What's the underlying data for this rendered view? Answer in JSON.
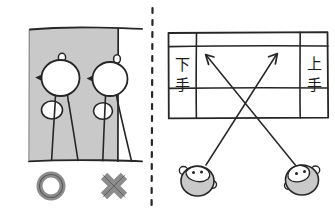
{
  "figure": {
    "background_color": "#ffffff",
    "ink_color": "#262626",
    "gray_fill_color": "#c9c9c9",
    "gray_mark_color": "#8c8c8c",
    "divider": {
      "name": "panel-divider",
      "style": "vertical-dashed",
      "x": 152,
      "y_start": 8,
      "y_end": 205,
      "dash_pattern": "5 7"
    }
  },
  "left_panel": {
    "name": "stage-position-illustration",
    "description": "Two stick figures on a gray stage floor area bounded by a vertical line",
    "stage_area": {
      "label": "gray stage floor",
      "x": 28,
      "y": 28,
      "width": 90,
      "height": 133
    },
    "boundary_line": {
      "name": "stage-edge-line",
      "orientation": "vertical",
      "x": 118
    },
    "figures": [
      {
        "name": "figure-correct",
        "position": "inside stage area",
        "verdict": "correct"
      },
      {
        "name": "figure-incorrect",
        "position": "straddling stage edge line",
        "verdict": "incorrect"
      }
    ],
    "verdict_marks": [
      {
        "name": "verdict-mark-circle",
        "symbol": "O",
        "meaning": "correct",
        "color": "#8c8c8c"
      },
      {
        "name": "verdict-mark-cross",
        "symbol": "X",
        "meaning": "incorrect",
        "color": "#8c8c8c"
      }
    ]
  },
  "right_panel": {
    "name": "stage-direction-diagram",
    "description": "Overhead grid of a stage with shimote and kamite labels and two crossing movement arrows originating from two character heads",
    "grid": {
      "name": "stage-grid",
      "x": 168,
      "y": 32,
      "width": 160,
      "height": 86,
      "columns": 3,
      "rows": 3,
      "vertical_dividers_x": [
        196,
        300
      ],
      "horizontal_dividers_y": [
        46,
        88
      ]
    },
    "labels": [
      {
        "name": "label-shimote",
        "text": "下手",
        "reading": "shimote",
        "meaning": "stage right (lower side, audience left)",
        "cell": "left column",
        "orientation": "vertical",
        "characters": [
          "下",
          "手"
        ]
      },
      {
        "name": "label-kamite",
        "text": "上手",
        "reading": "kamite",
        "meaning": "stage left (upper side, audience right)",
        "cell": "right column",
        "orientation": "vertical",
        "characters": [
          "上",
          "手"
        ]
      }
    ],
    "arrows": [
      {
        "name": "arrow-to-upper-left",
        "direction": "up-left",
        "from": "right character head",
        "to": "upper-left area of stage grid"
      },
      {
        "name": "arrow-to-upper-right",
        "direction": "up-right",
        "from": "left character head",
        "to": "upper-right area of stage grid"
      }
    ],
    "characters": [
      {
        "name": "character-head-left",
        "side": "left",
        "description": "round head with ears, gray lower half"
      },
      {
        "name": "character-head-right",
        "side": "right",
        "description": "round head with ears, gray lower half"
      }
    ]
  }
}
